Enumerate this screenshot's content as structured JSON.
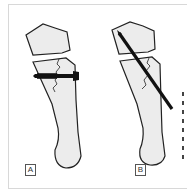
{
  "figure": {
    "panels": [
      {
        "id": "A",
        "label": "A",
        "device": "screw"
      },
      {
        "id": "B",
        "label": "B",
        "device": "pin"
      }
    ],
    "colors": {
      "bone_fill": "#ececec",
      "outline": "#222222",
      "implant": "#111111",
      "frame": "#d8d8d8"
    }
  }
}
